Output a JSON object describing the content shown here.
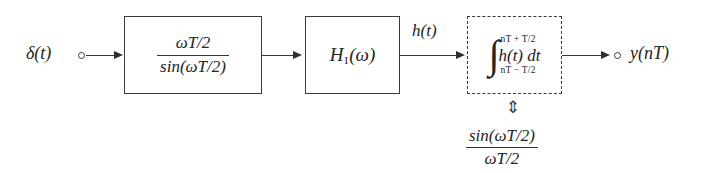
{
  "diagram": {
    "background_color": "#ffffff",
    "line_color": "#3a3a3a",
    "text_color": "#242424",
    "input": {
      "label": "δ(t)",
      "terminal": "open-circle"
    },
    "output": {
      "label": "y(nT)",
      "terminal": "open-circle"
    },
    "signals": {
      "intermediate_label": "h(t)"
    },
    "blocks": [
      {
        "id": "inverse-sinc-block",
        "border": "solid",
        "content_type": "fraction",
        "numerator": "ωT/2",
        "denominator": "sin(ωT/2)"
      },
      {
        "id": "interpolation-filter-block",
        "border": "solid",
        "content_type": "expression",
        "expression_base": "H",
        "expression_subscript": "I",
        "expression_argument": "(ω)"
      },
      {
        "id": "integrator-block",
        "border": "dashed",
        "content_type": "integral",
        "upper_limit": "nT + T/2",
        "lower_limit": "nT − T/2",
        "integrand": "h(t) dt",
        "integral_symbol": "∫"
      }
    ],
    "equivalence": {
      "arrow_glyph": "⇕",
      "arrow_name": "up-down-double-arrow",
      "numerator": "sin(ωT/2)",
      "denominator": "ωT/2"
    }
  }
}
